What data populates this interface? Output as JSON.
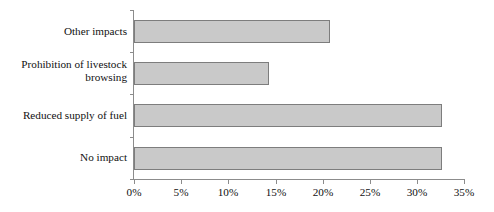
{
  "chart_data": {
    "type": "bar",
    "orientation": "horizontal",
    "title": "",
    "xlabel": "",
    "ylabel": "",
    "categories": [
      "Other impacts",
      "Prohibition of livestock\nbrowsing",
      "Reduced supply of fuel",
      "No impact"
    ],
    "values": [
      20.8,
      14.3,
      32.7,
      32.7
    ],
    "value_unit": "%",
    "xlim": [
      0,
      35
    ],
    "xticks": [
      0,
      5,
      10,
      15,
      20,
      25,
      30,
      35
    ],
    "xtick_labels": [
      "0%",
      "5%",
      "10%",
      "15%",
      "20%",
      "25%",
      "30%",
      "35%"
    ],
    "grid": false,
    "legend": false,
    "series": [
      {
        "name": "Share of respondents",
        "values": [
          20.8,
          14.3,
          32.7,
          32.7
        ]
      }
    ],
    "colors": {
      "bar_fill": "#c9c9c9",
      "bar_border": "#7d7d7d",
      "axis": "#8c8c8c",
      "text": "#111111",
      "background": "#ffffff"
    }
  }
}
